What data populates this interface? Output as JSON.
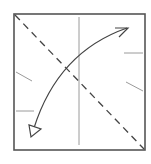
{
  "diagram": {
    "type": "origami-step",
    "description": "Square paper with dashed valley fold along the diagonal from top-left to bottom-right; curved fold-and-unfold arrow crossing the diagonal; vertical center crease; small reference tick marks on left and right edges",
    "colors": {
      "background": "#ffffff",
      "paper_edge": "#555555",
      "crease": "#9a9a9a",
      "fold_line": "#444444",
      "arrow": "#444444"
    },
    "paper": {
      "x": 14,
      "y": 14,
      "width": 131,
      "height": 136
    },
    "center_crease": {
      "x1": 79,
      "y1": 17,
      "x2": 79,
      "y2": 145
    },
    "valley_fold": {
      "x1": 14,
      "y1": 14,
      "x2": 145,
      "y2": 150,
      "style": "dashed"
    },
    "fold_arrow": {
      "start": [
        32,
        133
      ],
      "control": [
        58,
        52
      ],
      "end": [
        128,
        28
      ],
      "head_start": "hollow-triangle",
      "head_end": "open-half"
    },
    "ticks": [
      {
        "side": "left",
        "x1": 16,
        "y1": 72,
        "x2": 32,
        "y2": 81
      },
      {
        "side": "left",
        "x1": 16,
        "y1": 111,
        "x2": 34,
        "y2": 111
      },
      {
        "side": "right",
        "x1": 124,
        "y1": 53,
        "x2": 143,
        "y2": 53
      },
      {
        "side": "right",
        "x1": 126,
        "y1": 82,
        "x2": 143,
        "y2": 91
      }
    ]
  }
}
